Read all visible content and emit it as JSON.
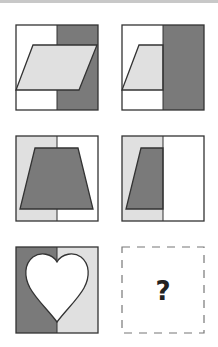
{
  "puzzle": {
    "type": "visual-analogy-matrix",
    "rows": 3,
    "cols": 2,
    "colors": {
      "outline": "#333333",
      "dark_gray": "#7a7a7a",
      "light_gray": "#e0e0e0",
      "white": "#ffffff",
      "dashed": "#777777"
    },
    "cells": [
      {
        "row": 1,
        "col": 1,
        "description": "Square split vertically: left white, right dark gray; light gray parallelogram overlaid across both halves"
      },
      {
        "row": 1,
        "col": 2,
        "description": "Square split vertically: left white, right dark gray; parallelogram visible only on left half"
      },
      {
        "row": 2,
        "col": 1,
        "description": "Square split vertically: left light gray, right white; dark gray trapezoid overlaid across both halves"
      },
      {
        "row": 2,
        "col": 2,
        "description": "Square split vertically: left light gray, right white; trapezoid visible only on left half"
      },
      {
        "row": 3,
        "col": 1,
        "description": "Square split vertically: left dark gray, right light gray; white heart overlaid across both halves"
      },
      {
        "row": 3,
        "col": 2,
        "description": "Missing answer (dashed box)",
        "placeholder": "?"
      }
    ],
    "answer_placeholder": "?"
  }
}
